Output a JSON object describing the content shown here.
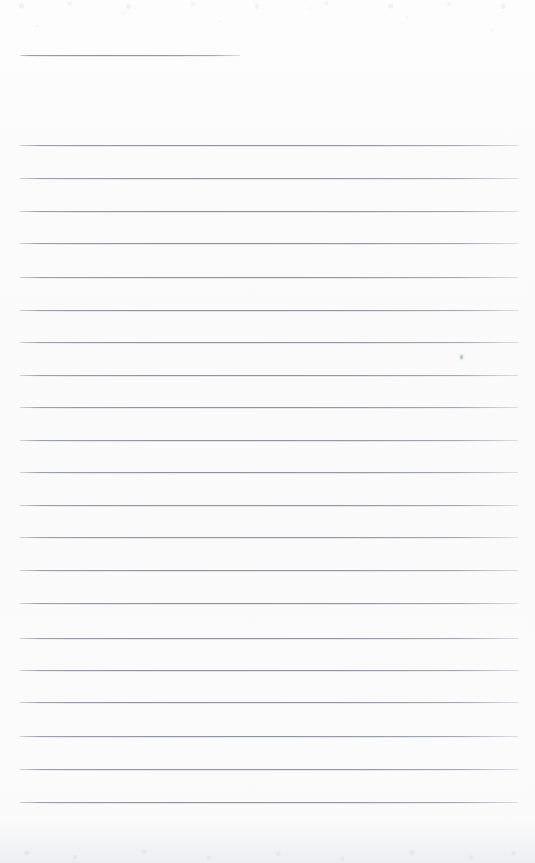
{
  "document": {
    "kind": "scanned-blank-ruled-page",
    "page_width": 535,
    "page_height": 863,
    "background_color": "#fbfbfc",
    "rule_color": "#92979f",
    "rule_thickness": 1,
    "has_text_content": false,
    "visible_text": ""
  },
  "ruling": {
    "left_x": 20,
    "right_x": 518,
    "line_spacing": 32.6,
    "line_count": 23,
    "lines": [
      {
        "index": 1,
        "y": 55,
        "x1": 20,
        "x2": 240,
        "short": true
      },
      {
        "index": 2,
        "y": 145,
        "x1": 20,
        "x2": 518,
        "short": false
      },
      {
        "index": 3,
        "y": 178,
        "x1": 20,
        "x2": 518,
        "short": false
      },
      {
        "index": 4,
        "y": 211,
        "x1": 20,
        "x2": 518,
        "short": false
      },
      {
        "index": 5,
        "y": 243,
        "x1": 20,
        "x2": 518,
        "short": false
      },
      {
        "index": 6,
        "y": 277,
        "x1": 20,
        "x2": 518,
        "short": false
      },
      {
        "index": 7,
        "y": 310,
        "x1": 20,
        "x2": 518,
        "short": false
      },
      {
        "index": 8,
        "y": 342,
        "x1": 20,
        "x2": 518,
        "short": false
      },
      {
        "index": 9,
        "y": 375,
        "x1": 20,
        "x2": 518,
        "short": false
      },
      {
        "index": 10,
        "y": 407,
        "x1": 20,
        "x2": 518,
        "short": false
      },
      {
        "index": 11,
        "y": 440,
        "x1": 20,
        "x2": 518,
        "short": false
      },
      {
        "index": 12,
        "y": 472,
        "x1": 20,
        "x2": 518,
        "short": false
      },
      {
        "index": 13,
        "y": 505,
        "x1": 20,
        "x2": 518,
        "short": false
      },
      {
        "index": 14,
        "y": 537,
        "x1": 20,
        "x2": 518,
        "short": false
      },
      {
        "index": 15,
        "y": 570,
        "x1": 20,
        "x2": 518,
        "short": false
      },
      {
        "index": 16,
        "y": 603,
        "x1": 20,
        "x2": 518,
        "short": false
      },
      {
        "index": 17,
        "y": 638,
        "x1": 20,
        "x2": 518,
        "short": false
      },
      {
        "index": 18,
        "y": 670,
        "x1": 20,
        "x2": 518,
        "short": false
      },
      {
        "index": 19,
        "y": 702,
        "x1": 20,
        "x2": 518,
        "short": false
      },
      {
        "index": 20,
        "y": 736,
        "x1": 20,
        "x2": 518,
        "short": false
      },
      {
        "index": 21,
        "y": 769,
        "x1": 20,
        "x2": 518,
        "short": false
      },
      {
        "index": 22,
        "y": 802,
        "x1": 20,
        "x2": 518,
        "short": false
      }
    ]
  },
  "artifacts": {
    "specks": [
      {
        "x": 460,
        "y": 355
      }
    ],
    "bottom_band_height": 42,
    "top_speckle_height": 20
  }
}
